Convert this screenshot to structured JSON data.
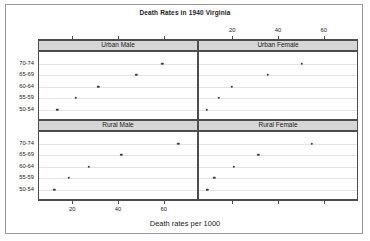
{
  "chart_data": {
    "type": "scatter",
    "title": "Death Rates in 1940 Virginia",
    "xlabel": "Death rates per 1000",
    "ylabel": "",
    "xlim": [
      5,
      75
    ],
    "grid": true,
    "legend": "none",
    "layout": "trellis 2x2",
    "panel_variable": "Population group",
    "categories": [
      "50-54",
      "55-59",
      "60-64",
      "65-69",
      "70-74"
    ],
    "x_ticks": [
      20,
      40,
      60
    ],
    "x_ticks_top": [
      20,
      40,
      60
    ],
    "panels": [
      {
        "name": "Urban Male",
        "row": 0,
        "col": 0,
        "points": [
          {
            "age": "50-54",
            "rate": 13.0
          },
          {
            "age": "55-59",
            "rate": 21.1
          },
          {
            "age": "60-64",
            "rate": 30.9
          },
          {
            "age": "65-69",
            "rate": 47.6
          },
          {
            "age": "70-74",
            "rate": 59.0
          }
        ]
      },
      {
        "name": "Urban Female",
        "row": 0,
        "col": 1,
        "points": [
          {
            "age": "50-54",
            "rate": 8.4
          },
          {
            "age": "55-59",
            "rate": 13.6
          },
          {
            "age": "60-64",
            "rate": 19.3
          },
          {
            "age": "65-69",
            "rate": 35.1
          },
          {
            "age": "70-74",
            "rate": 50.0
          }
        ]
      },
      {
        "name": "Rural Male",
        "row": 1,
        "col": 0,
        "points": [
          {
            "age": "50-54",
            "rate": 11.7
          },
          {
            "age": "55-59",
            "rate": 18.1
          },
          {
            "age": "60-64",
            "rate": 26.9
          },
          {
            "age": "65-69",
            "rate": 41.0
          },
          {
            "age": "70-74",
            "rate": 66.0
          }
        ]
      },
      {
        "name": "Rural Female",
        "row": 1,
        "col": 1,
        "points": [
          {
            "age": "50-54",
            "rate": 8.7
          },
          {
            "age": "55-59",
            "rate": 11.7
          },
          {
            "age": "60-64",
            "rate": 20.3
          },
          {
            "age": "65-69",
            "rate": 30.9
          },
          {
            "age": "70-74",
            "rate": 54.3
          }
        ]
      }
    ],
    "colors": {
      "point": "#3a3a3a",
      "strip_background": "#d6d6d6",
      "panel_border": "#4c4c4c",
      "gridline": "#e4e4e4",
      "frame": "#9a9a9a",
      "background": "#ffffff"
    }
  }
}
